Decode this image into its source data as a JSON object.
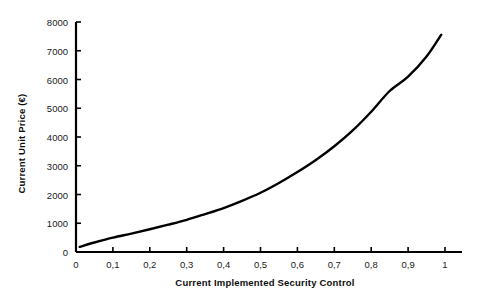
{
  "chart_data": {
    "type": "line",
    "title": "",
    "xlabel": "Current Implemented Security Control",
    "ylabel": "Current Unit Price (€)",
    "xlim": [
      0,
      1.04
    ],
    "ylim": [
      0,
      8000
    ],
    "grid": false,
    "legend": null,
    "xticks": [
      0,
      0.1,
      0.2,
      0.3,
      0.4,
      0.5,
      0.6,
      0.7,
      0.8,
      0.9,
      1
    ],
    "xtick_labels": [
      "0",
      "0,1",
      "0,2",
      "0,3",
      "0,4",
      "0,5",
      "0,6",
      "0,7",
      "0,8",
      "0,9",
      "1"
    ],
    "yticks": [
      0,
      1000,
      2000,
      3000,
      4000,
      5000,
      6000,
      7000,
      8000
    ],
    "ytick_labels": [
      "0",
      "1000",
      "2000",
      "3000",
      "4000",
      "5000",
      "6000",
      "7000",
      "8000"
    ],
    "series": [
      {
        "name": "Current Unit Price",
        "color": "#000000",
        "line_width": 2.4,
        "x": [
          0.01,
          0.05,
          0.1,
          0.15,
          0.2,
          0.25,
          0.3,
          0.35,
          0.4,
          0.45,
          0.5,
          0.55,
          0.6,
          0.65,
          0.7,
          0.75,
          0.8,
          0.85,
          0.9,
          0.95,
          0.99
        ],
        "y": [
          180,
          330,
          500,
          640,
          790,
          950,
          1120,
          1320,
          1530,
          1780,
          2060,
          2400,
          2780,
          3200,
          3680,
          4230,
          4880,
          5600,
          6100,
          6800,
          7560
        ]
      }
    ]
  },
  "axes": {
    "x_axis_title": "Current Implemented Security Control",
    "y_axis_title": "Current Unit Price (€)"
  }
}
